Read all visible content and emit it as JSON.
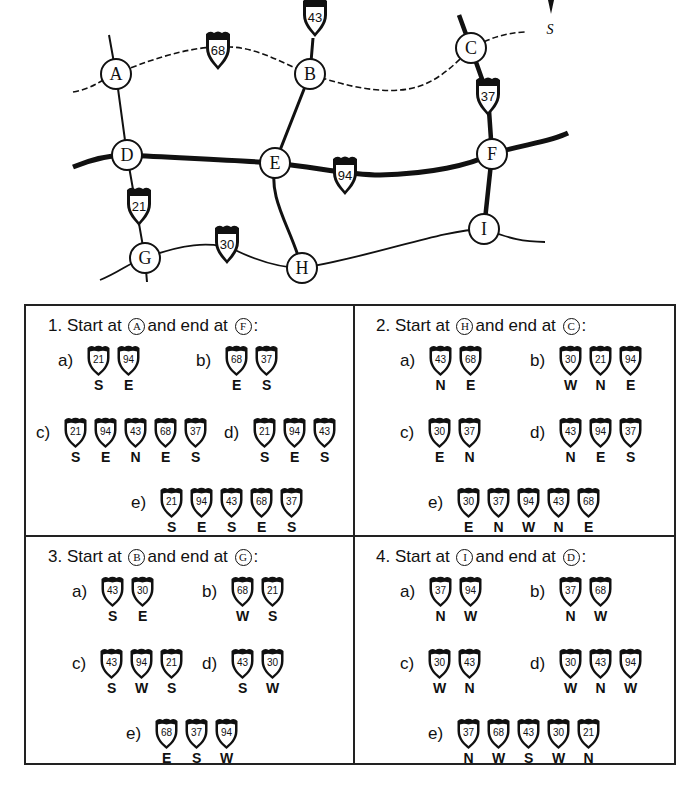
{
  "map": {
    "compass_label": "S",
    "nodes": [
      {
        "id": "A",
        "x": 116,
        "y": 74
      },
      {
        "id": "B",
        "x": 310,
        "y": 74
      },
      {
        "id": "C",
        "x": 471,
        "y": 48
      },
      {
        "id": "D",
        "x": 127,
        "y": 155
      },
      {
        "id": "E",
        "x": 275,
        "y": 163
      },
      {
        "id": "F",
        "x": 492,
        "y": 154
      },
      {
        "id": "G",
        "x": 145,
        "y": 258
      },
      {
        "id": "H",
        "x": 302,
        "y": 268
      },
      {
        "id": "I",
        "x": 484,
        "y": 229
      }
    ],
    "shields": [
      {
        "number": "43",
        "x": 315,
        "y": 17
      },
      {
        "number": "68",
        "x": 218,
        "y": 50
      },
      {
        "number": "37",
        "x": 488,
        "y": 96
      },
      {
        "number": "94",
        "x": 345,
        "y": 175
      },
      {
        "number": "21",
        "x": 139,
        "y": 206
      },
      {
        "number": "30",
        "x": 227,
        "y": 244
      }
    ]
  },
  "questions": [
    {
      "number": "1.",
      "prefix": "Start at",
      "start": "A",
      "middle": "and end at",
      "end": "F",
      "suffix": ":",
      "options": [
        {
          "label": "a)",
          "steps": [
            {
              "route": "21",
              "dir": "S"
            },
            {
              "route": "94",
              "dir": "E"
            }
          ]
        },
        {
          "label": "b)",
          "steps": [
            {
              "route": "68",
              "dir": "E"
            },
            {
              "route": "37",
              "dir": "S"
            }
          ]
        },
        {
          "label": "c)",
          "steps": [
            {
              "route": "21",
              "dir": "S"
            },
            {
              "route": "94",
              "dir": "E"
            },
            {
              "route": "43",
              "dir": "N"
            },
            {
              "route": "68",
              "dir": "E"
            },
            {
              "route": "37",
              "dir": "S"
            }
          ]
        },
        {
          "label": "d)",
          "steps": [
            {
              "route": "21",
              "dir": "S"
            },
            {
              "route": "94",
              "dir": "E"
            },
            {
              "route": "43",
              "dir": "S"
            }
          ]
        },
        {
          "label": "e)",
          "steps": [
            {
              "route": "21",
              "dir": "S"
            },
            {
              "route": "94",
              "dir": "E"
            },
            {
              "route": "43",
              "dir": "S"
            },
            {
              "route": "68",
              "dir": "E"
            },
            {
              "route": "37",
              "dir": "S"
            }
          ]
        }
      ]
    },
    {
      "number": "2.",
      "prefix": "Start at",
      "start": "H",
      "middle": "and end at",
      "end": "C",
      "suffix": ":",
      "options": [
        {
          "label": "a)",
          "steps": [
            {
              "route": "43",
              "dir": "N"
            },
            {
              "route": "68",
              "dir": "E"
            }
          ]
        },
        {
          "label": "b)",
          "steps": [
            {
              "route": "30",
              "dir": "W"
            },
            {
              "route": "21",
              "dir": "N"
            },
            {
              "route": "94",
              "dir": "E"
            }
          ]
        },
        {
          "label": "c)",
          "steps": [
            {
              "route": "30",
              "dir": "E"
            },
            {
              "route": "37",
              "dir": "N"
            }
          ]
        },
        {
          "label": "d)",
          "steps": [
            {
              "route": "43",
              "dir": "N"
            },
            {
              "route": "94",
              "dir": "E"
            },
            {
              "route": "37",
              "dir": "S"
            }
          ]
        },
        {
          "label": "e)",
          "steps": [
            {
              "route": "30",
              "dir": "E"
            },
            {
              "route": "37",
              "dir": "N"
            },
            {
              "route": "94",
              "dir": "W"
            },
            {
              "route": "43",
              "dir": "N"
            },
            {
              "route": "68",
              "dir": "E"
            }
          ]
        }
      ]
    },
    {
      "number": "3.",
      "prefix": "Start at",
      "start": "B",
      "middle": "and end at",
      "end": "G",
      "suffix": ":",
      "options": [
        {
          "label": "a)",
          "steps": [
            {
              "route": "43",
              "dir": "S"
            },
            {
              "route": "30",
              "dir": "E"
            }
          ]
        },
        {
          "label": "b)",
          "steps": [
            {
              "route": "68",
              "dir": "W"
            },
            {
              "route": "21",
              "dir": "S"
            }
          ]
        },
        {
          "label": "c)",
          "steps": [
            {
              "route": "43",
              "dir": "S"
            },
            {
              "route": "94",
              "dir": "W"
            },
            {
              "route": "21",
              "dir": "S"
            }
          ]
        },
        {
          "label": "d)",
          "steps": [
            {
              "route": "43",
              "dir": "S"
            },
            {
              "route": "30",
              "dir": "W"
            }
          ]
        },
        {
          "label": "e)",
          "steps": [
            {
              "route": "68",
              "dir": "E"
            },
            {
              "route": "37",
              "dir": "S"
            },
            {
              "route": "94",
              "dir": "W"
            }
          ]
        }
      ]
    },
    {
      "number": "4.",
      "prefix": "Start at",
      "start": "I",
      "middle": "and end at",
      "end": "D",
      "suffix": ":",
      "options": [
        {
          "label": "a)",
          "steps": [
            {
              "route": "37",
              "dir": "N"
            },
            {
              "route": "94",
              "dir": "W"
            }
          ]
        },
        {
          "label": "b)",
          "steps": [
            {
              "route": "37",
              "dir": "N"
            },
            {
              "route": "68",
              "dir": "W"
            }
          ]
        },
        {
          "label": "c)",
          "steps": [
            {
              "route": "30",
              "dir": "W"
            },
            {
              "route": "43",
              "dir": "N"
            }
          ]
        },
        {
          "label": "d)",
          "steps": [
            {
              "route": "30",
              "dir": "W"
            },
            {
              "route": "43",
              "dir": "N"
            },
            {
              "route": "94",
              "dir": "W"
            }
          ]
        },
        {
          "label": "e)",
          "steps": [
            {
              "route": "37",
              "dir": "N"
            },
            {
              "route": "68",
              "dir": "W"
            },
            {
              "route": "43",
              "dir": "S"
            },
            {
              "route": "30",
              "dir": "W"
            },
            {
              "route": "21",
              "dir": "N"
            }
          ]
        }
      ]
    }
  ]
}
